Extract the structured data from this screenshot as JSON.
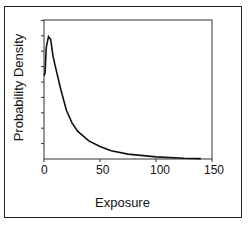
{
  "chart_data": {
    "type": "line",
    "title": "",
    "xlabel": "Exposure",
    "ylabel": "Probability Density",
    "xlim": [
      0,
      150
    ],
    "x_ticks": [
      0,
      50,
      100,
      150
    ],
    "y_ticks_labeled": false,
    "grid": false,
    "legend": null,
    "series": [
      {
        "name": "density",
        "x": [
          0,
          1,
          2,
          4,
          6,
          8,
          10,
          15,
          20,
          25,
          30,
          40,
          50,
          60,
          75,
          100,
          125,
          140
        ],
        "y": [
          0.6,
          0.62,
          0.8,
          0.88,
          0.86,
          0.74,
          0.67,
          0.5,
          0.35,
          0.26,
          0.2,
          0.13,
          0.09,
          0.06,
          0.035,
          0.015,
          0.006,
          0.003
        ]
      }
    ]
  },
  "labels": {
    "x_axis": "Exposure",
    "y_axis": "Probability Density",
    "ticks": [
      "0",
      "50",
      "100",
      "150"
    ]
  }
}
